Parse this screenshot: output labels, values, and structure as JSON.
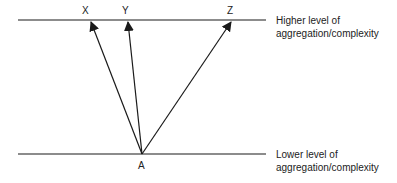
{
  "diagram": {
    "levels": {
      "higher": {
        "line1": "Higher level of",
        "line2": "aggregation/complexity"
      },
      "lower": {
        "line1": "Lower level of",
        "line2": "aggregation/complexity"
      }
    },
    "points": {
      "origin": "A",
      "targets": [
        "X",
        "Y",
        "Z"
      ]
    },
    "edges": [
      {
        "from": "A",
        "to": "X"
      },
      {
        "from": "A",
        "to": "Y"
      },
      {
        "from": "A",
        "to": "Z"
      }
    ],
    "colors": {
      "line": "#1a1a1a",
      "text": "#222222"
    }
  }
}
